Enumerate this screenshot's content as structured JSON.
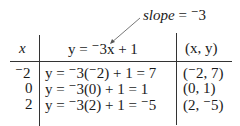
{
  "annotation": {
    "slope_label": "slope",
    "slope_eq": " = ",
    "slope_value": "⁻3"
  },
  "table": {
    "headers": {
      "x": "x",
      "equation": "y = ⁻3x + 1",
      "pair": "(x, y)"
    },
    "rows": [
      {
        "x": "⁻2",
        "equation": "y = ⁻3(⁻2) + 1 = 7",
        "pair": "(⁻2, 7)"
      },
      {
        "x": "0",
        "equation": "y = ⁻3(0) + 1 = 1",
        "pair": "(0, 1)"
      },
      {
        "x": "2",
        "equation": "y = ⁻3(2) + 1 = ⁻5",
        "pair": "(2, ⁻5)"
      }
    ]
  }
}
